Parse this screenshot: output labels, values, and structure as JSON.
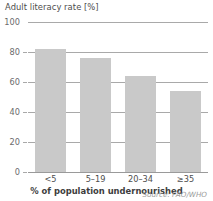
{
  "chart_data": {
    "type": "bar",
    "title": "",
    "ylabel": "Adult literacy rate [%]",
    "xlabel": "% of population undernourished",
    "categories": [
      "<5",
      "5–19",
      "20–34",
      "≥35"
    ],
    "values": [
      82,
      76,
      64,
      54
    ],
    "ylim": [
      0,
      100
    ],
    "yticks": [
      0,
      20,
      40,
      60,
      80,
      100
    ],
    "ytick_labels": [
      "0",
      "20",
      "40",
      "60",
      "80",
      "100"
    ],
    "grid": true,
    "legend": false,
    "series": [
      {
        "name": "Adult literacy rate",
        "values": [
          82,
          76,
          64,
          54
        ]
      }
    ],
    "source_note": "Source: FAO/WHO",
    "colors": {
      "bar_fill": "#c9c9c9",
      "gridline": "#a9a9a9",
      "tick_text": "#6b6b6b",
      "label_text": "#4d4d4d",
      "source_text": "#9b9b9b",
      "background": "#ffffff"
    }
  }
}
